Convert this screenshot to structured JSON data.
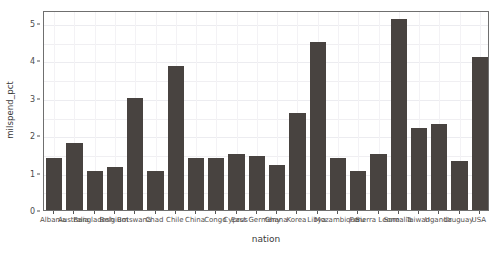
{
  "chart_data": {
    "type": "bar",
    "title": "",
    "xlabel": "nation",
    "ylabel": "milspend_pct",
    "ylim": [
      0,
      5.35
    ],
    "yticks": [
      0,
      1,
      2,
      3,
      4,
      5
    ],
    "ytick_labels": [
      "0",
      "1",
      "2",
      "3",
      "4",
      "5"
    ],
    "grid": true,
    "legend": "none",
    "bar_color": "#484340",
    "panel_background": "#ffffff",
    "grid_color": "#f0eff2",
    "axis_color": "#6f6f6f",
    "categories": [
      "Albania",
      "Australia",
      "Bangladesh",
      "Belgium",
      "Botswana",
      "Chad",
      "Chile",
      "China",
      "Congo",
      "Cyprus",
      "East Germany",
      "Ghana",
      "Korea",
      "Libya",
      "Mozambique",
      "Peru",
      "Sierra Leone",
      "Somalia",
      "Taiwan",
      "Uganda",
      "Uruguay",
      "USA"
    ],
    "values": [
      1.4,
      1.8,
      1.05,
      1.15,
      3.0,
      1.05,
      3.85,
      1.4,
      1.4,
      1.5,
      1.45,
      1.2,
      2.6,
      4.5,
      1.4,
      1.05,
      1.5,
      5.1,
      2.2,
      2.3,
      1.3,
      4.1
    ]
  }
}
